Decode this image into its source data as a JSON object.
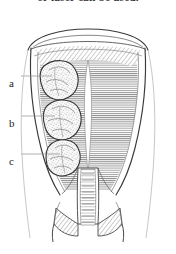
{
  "caption": {
    "text": "or laser can be used."
  },
  "figure": {
    "background_color": "#ffffff",
    "ink_color": "#2b2b2b",
    "hatch_color": "#6d6d6d",
    "mass_fill": "#f4f4f4",
    "labels": [
      {
        "id": "a",
        "text": "a",
        "target": "upper-fibroid"
      },
      {
        "id": "b",
        "text": "b",
        "target": "middle-fibroid"
      },
      {
        "id": "c",
        "text": "c",
        "target": "lower-fibroid"
      }
    ],
    "parts": [
      "fundus",
      "myometrium",
      "endometrial-cavity",
      "cervical-canal",
      "vaginal-fornix-left",
      "vaginal-fornix-right"
    ]
  }
}
